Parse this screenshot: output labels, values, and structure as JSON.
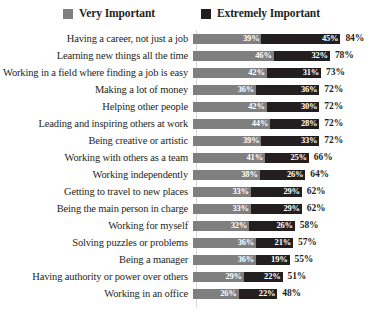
{
  "legend": {
    "entries": [
      {
        "label": "Very Important",
        "color": "#7f7f7f",
        "icon": "square-swatch"
      },
      {
        "label": "Extremely Important",
        "color": "#231f20",
        "icon": "square-swatch"
      }
    ]
  },
  "chart_data": {
    "type": "bar",
    "orientation": "horizontal",
    "stacked": true,
    "title": "",
    "subtitle": "",
    "xlabel": "",
    "ylabel": "",
    "xlim": [
      0,
      100
    ],
    "grid": false,
    "legend_position": "top-center",
    "axis_line": true,
    "value_suffix": "%",
    "categories": [
      "Having a career, not just a job",
      "Learning new things all the time",
      "Working in a field where finding a job is easy",
      "Making a lot of money",
      "Helping other people",
      "Leading and inspiring others at work",
      "Being creative or artistic",
      "Working with others as a team",
      "Working independently",
      "Getting to travel to new places",
      "Being the main person in charge",
      "Working for myself",
      "Solving puzzles or problems",
      "Being a manager",
      "Having authority or power over others",
      "Working in an office"
    ],
    "series": [
      {
        "name": "Very Important",
        "color": "#7f7f7f",
        "values": [
          39,
          46,
          42,
          36,
          42,
          44,
          39,
          41,
          38,
          33,
          33,
          32,
          36,
          36,
          29,
          26
        ],
        "labels": [
          "39%",
          "46%",
          "42%",
          "36%",
          "42%",
          "44%",
          "39%",
          "41%",
          "38%",
          "33%",
          "33%",
          "32%",
          "36%",
          "36%",
          "29%",
          "26%"
        ]
      },
      {
        "name": "Extremely Important",
        "color": "#231f20",
        "values": [
          45,
          32,
          31,
          36,
          30,
          28,
          33,
          25,
          26,
          29,
          29,
          26,
          21,
          19,
          22,
          22
        ],
        "labels": [
          "45%",
          "32%",
          "31%",
          "36%",
          "30%",
          "28%",
          "33%",
          "25%",
          "26%",
          "29%",
          "29%",
          "26%",
          "21%",
          "19%",
          "22%",
          "22%"
        ]
      }
    ],
    "totals": [
      84,
      78,
      73,
      72,
      72,
      72,
      72,
      66,
      64,
      62,
      62,
      58,
      57,
      55,
      51,
      48
    ],
    "total_labels": [
      "84%",
      "78%",
      "73%",
      "72%",
      "72%",
      "72%",
      "72%",
      "66%",
      "64%",
      "62%",
      "62%",
      "58%",
      "57%",
      "55%",
      "51%",
      "48%"
    ]
  }
}
